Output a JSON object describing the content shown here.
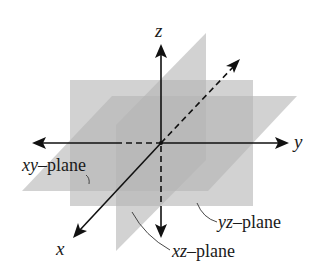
{
  "figure": {
    "axes": {
      "x": {
        "label": "x"
      },
      "y": {
        "label": "y"
      },
      "z": {
        "label": "z"
      }
    },
    "planes": [
      {
        "id": "xy",
        "var_part": "xy",
        "suffix": "–plane"
      },
      {
        "id": "yz",
        "var_part": "yz",
        "suffix": "–plane"
      },
      {
        "id": "xz",
        "var_part": "xz",
        "suffix": "–plane"
      }
    ],
    "colors": {
      "plane_fill": "#b4b4b4",
      "plane_opacity": 0.6,
      "axis": "#111111",
      "background": "#ffffff"
    }
  }
}
